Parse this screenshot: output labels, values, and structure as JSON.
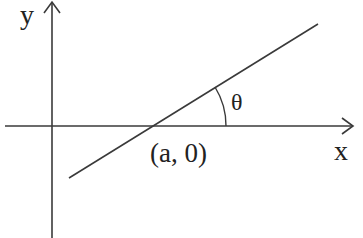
{
  "diagram": {
    "type": "coordinate-geometry",
    "labels": {
      "y_axis": "y",
      "x_axis": "x",
      "point": "(a, 0)",
      "angle": "θ"
    },
    "colors": {
      "stroke": "#3a3a3a",
      "text": "#222222",
      "background": "#ffffff"
    }
  }
}
